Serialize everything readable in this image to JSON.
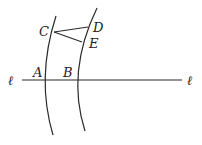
{
  "diagram": {
    "line_label_left": "ℓ",
    "line_label_right": "ℓ",
    "points": {
      "A": "A",
      "B": "B",
      "C": "C",
      "D": "D",
      "E": "E"
    },
    "colors": {
      "ink": "#2a2a2a",
      "background": "#ffffff"
    }
  }
}
